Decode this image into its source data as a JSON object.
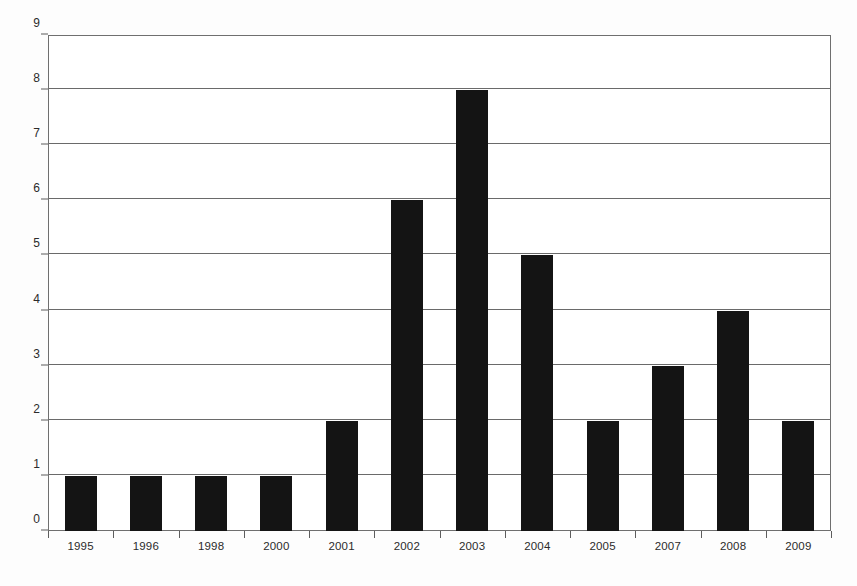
{
  "chart_data": {
    "type": "bar",
    "title": "",
    "subtitle": "",
    "xlabel": "",
    "ylabel": "",
    "categories": [
      "1995",
      "1996",
      "1998",
      "2000",
      "2001",
      "2002",
      "2003",
      "2004",
      "2005",
      "2007",
      "2008",
      "2009"
    ],
    "values": [
      1,
      1,
      1,
      1,
      2,
      6,
      8,
      5,
      2,
      3,
      4,
      2
    ],
    "ylim": [
      0,
      9
    ],
    "y_ticks": [
      0,
      1,
      2,
      3,
      4,
      5,
      6,
      7,
      8,
      9
    ],
    "grid": true,
    "legend": false,
    "legend_position": "none",
    "annotations": [],
    "colors": {
      "bar": "#141414",
      "gridline": "#6a6a6a",
      "axis": "#5d5d5d",
      "plot_border": "#6f6f6f",
      "background": "#fdfdfd",
      "plot_background": "#ffffff",
      "tick_label": "#2b2b2b"
    }
  }
}
